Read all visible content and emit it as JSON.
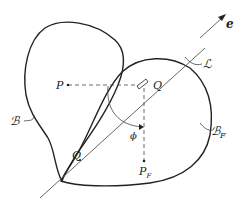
{
  "diagram": {
    "labels": {
      "e": "e",
      "L": "ℒ",
      "P": "P",
      "Q_top": "Q",
      "Q_bottom": "Q",
      "B": "ℬ",
      "B_F": "ℬ",
      "B_F_sub": "F",
      "phi": "ϕ",
      "P_F": "P",
      "P_F_sub": "F"
    },
    "colors": {
      "stroke": "#222222",
      "axis": "#555555",
      "dashed": "#444444",
      "background": "#ffffff"
    }
  }
}
